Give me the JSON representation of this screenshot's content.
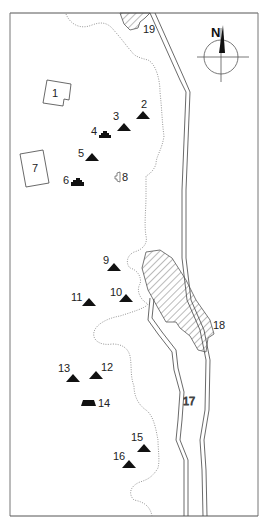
{
  "map": {
    "compass": {
      "label": "N"
    },
    "colors": {
      "ink": "#1a1a1a",
      "line": "#555555",
      "dotted": "#8a8a8a",
      "hatch": "#555555",
      "paper": "#ffffff"
    },
    "sites": [
      {
        "id": "1",
        "label": "1",
        "symbol": "building-outline",
        "x": 24,
        "y": 82
      },
      {
        "id": "2",
        "label": "2",
        "symbol": "triangle",
        "x": 143,
        "y": 104
      },
      {
        "id": "3",
        "label": "3",
        "symbol": "triangle",
        "x": 123,
        "y": 123
      },
      {
        "id": "4",
        "label": "4",
        "symbol": "stepped-pyramid",
        "x": 105,
        "y": 134
      },
      {
        "id": "5",
        "label": "5",
        "symbol": "triangle",
        "x": 92,
        "y": 158
      },
      {
        "id": "6",
        "label": "6",
        "symbol": "stepped-pyramid",
        "x": 78,
        "y": 182
      },
      {
        "id": "7",
        "label": "7",
        "symbol": "building-outline",
        "x": 20,
        "y": 150
      },
      {
        "id": "8",
        "label": "8",
        "symbol": "small-outline",
        "x": 117,
        "y": 177
      },
      {
        "id": "9",
        "label": "9",
        "symbol": "triangle",
        "x": 113,
        "y": 268
      },
      {
        "id": "10",
        "label": "10",
        "symbol": "triangle",
        "x": 126,
        "y": 298
      },
      {
        "id": "11",
        "label": "11",
        "symbol": "triangle",
        "x": 88,
        "y": 302
      },
      {
        "id": "12",
        "label": "12",
        "symbol": "triangle",
        "x": 96,
        "y": 376
      },
      {
        "id": "13",
        "label": "13",
        "symbol": "triangle",
        "x": 72,
        "y": 379
      },
      {
        "id": "14",
        "label": "14",
        "symbol": "platform",
        "x": 88,
        "y": 403
      },
      {
        "id": "15",
        "label": "15",
        "symbol": "triangle",
        "x": 144,
        "y": 448
      },
      {
        "id": "16",
        "label": "16",
        "symbol": "triangle",
        "x": 129,
        "y": 465
      }
    ],
    "features": [
      {
        "id": "17",
        "label": "17",
        "type": "river-channel"
      },
      {
        "id": "18",
        "label": "18",
        "type": "hatched-area"
      },
      {
        "id": "19",
        "label": "19",
        "type": "hatched-area"
      }
    ]
  }
}
